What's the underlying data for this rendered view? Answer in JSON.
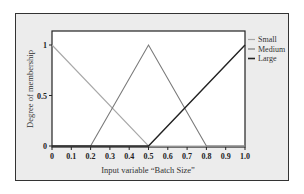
{
  "chart_data": {
    "type": "line",
    "title": "",
    "xlabel": "Input variable “Batch Size”",
    "ylabel": "Degree of membership",
    "xlim": [
      0,
      1.0
    ],
    "ylim": [
      0,
      1.1
    ],
    "grid": false,
    "legend_position": "right",
    "x_ticks": [
      "0",
      "0.1",
      "0.2",
      "0.3",
      "0.4",
      "0.5",
      "0.6",
      "0.7",
      "0.8",
      "0.9",
      "1.0"
    ],
    "y_ticks": [
      "0",
      "0.5",
      "1"
    ],
    "series": [
      {
        "name": "Small",
        "color": "#a8a8a8",
        "x": [
          0,
          0.5,
          1.0
        ],
        "y": [
          1,
          0,
          0
        ]
      },
      {
        "name": "Medium",
        "color": "#7a7a7a",
        "x": [
          0,
          0.2,
          0.5,
          0.8,
          1.0
        ],
        "y": [
          0,
          0,
          1,
          0,
          0
        ]
      },
      {
        "name": "Large",
        "color": "#222222",
        "x": [
          0,
          0.5,
          1.0
        ],
        "y": [
          0,
          0,
          1
        ]
      }
    ]
  }
}
